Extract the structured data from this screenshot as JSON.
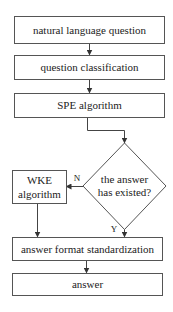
{
  "diagram": {
    "type": "flowchart",
    "nodes": {
      "n1": {
        "label": "natural language question",
        "shape": "rectangle"
      },
      "n2": {
        "label": "question classification",
        "shape": "rectangle"
      },
      "n3": {
        "label": "SPE algorithm",
        "shape": "rectangle"
      },
      "decision": {
        "line1": "the answer",
        "line2": "has existed?",
        "shape": "diamond"
      },
      "wke": {
        "line1": "WKE",
        "line2": "algorithm",
        "shape": "rectangle"
      },
      "n5": {
        "label": "answer format standardization",
        "shape": "rectangle"
      },
      "n6": {
        "label": "answer",
        "shape": "rectangle"
      }
    },
    "edge_labels": {
      "no": "N",
      "yes": "Y"
    },
    "edges": [
      {
        "from": "n1",
        "to": "n2"
      },
      {
        "from": "n2",
        "to": "n3"
      },
      {
        "from": "n3",
        "to": "decision"
      },
      {
        "from": "decision",
        "to": "wke",
        "label": "N"
      },
      {
        "from": "decision",
        "to": "n5",
        "label": "Y"
      },
      {
        "from": "wke",
        "to": "n5"
      },
      {
        "from": "n5",
        "to": "n6"
      }
    ]
  }
}
